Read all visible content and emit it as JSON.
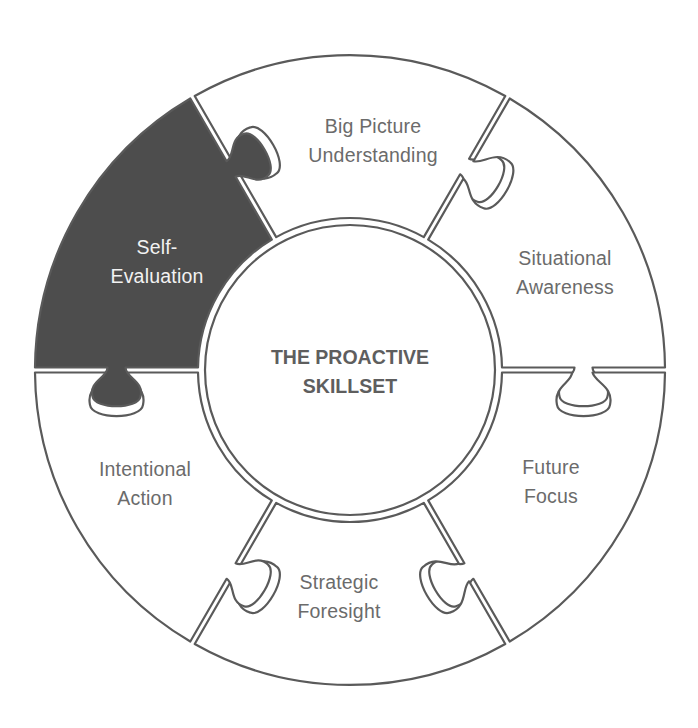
{
  "diagram": {
    "title_line1": "THE PROACTIVE",
    "title_line2": "SKILLSET",
    "colors": {
      "stroke": "#5a5a5a",
      "highlight_fill": "#4d4d4d",
      "segment_fill": "#ffffff",
      "label_text": "#6b6b6b",
      "highlight_text": "#f2f2f2"
    },
    "segments": [
      {
        "id": "big-picture-understanding",
        "line1": "Big Picture",
        "line2": "Understanding",
        "highlighted": false
      },
      {
        "id": "situational-awareness",
        "line1": "Situational",
        "line2": "Awareness",
        "highlighted": false
      },
      {
        "id": "future-focus",
        "line1": "Future",
        "line2": "Focus",
        "highlighted": false
      },
      {
        "id": "strategic-foresight",
        "line1": "Strategic",
        "line2": "Foresight",
        "highlighted": false
      },
      {
        "id": "intentional-action",
        "line1": "Intentional",
        "line2": "Action",
        "highlighted": false
      },
      {
        "id": "self-evaluation",
        "line1": "Self-",
        "line2": "Evaluation",
        "highlighted": true
      }
    ]
  }
}
